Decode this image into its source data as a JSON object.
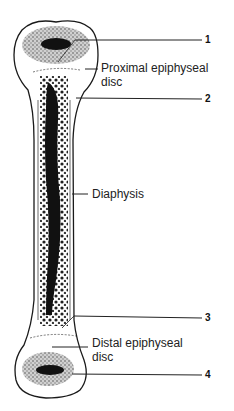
{
  "diagram": {
    "labels": {
      "n1": "1",
      "n2": "2",
      "n3": "3",
      "n4": "4",
      "proximal_line1": "Proximal epiphyseal",
      "proximal_line2": "disc",
      "diaphysis": "Diaphysis",
      "distal_line1": "Distal epiphyseal",
      "distal_line2": "disc"
    },
    "colors": {
      "ink": "#1a1a1a",
      "spongy": "#8a8a8a",
      "marrow": "#111111",
      "background": "#ffffff"
    }
  }
}
